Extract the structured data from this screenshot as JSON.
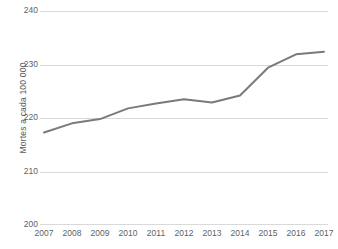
{
  "chart_data": {
    "type": "line",
    "title": "",
    "xlabel": "",
    "ylabel": "Mortes a cada 100 000",
    "categories": [
      "2007",
      "2008",
      "2009",
      "2010",
      "2011",
      "2012",
      "2013",
      "2014",
      "2015",
      "2016",
      "2017"
    ],
    "values": [
      217.3,
      219.0,
      219.8,
      221.8,
      222.7,
      223.5,
      222.9,
      224.2,
      229.4,
      231.9,
      232.4
    ],
    "series": [
      {
        "name": "Mortes a cada 100 000",
        "values": [
          217.3,
          219.0,
          219.8,
          221.8,
          222.7,
          223.5,
          222.9,
          224.2,
          229.4,
          231.9,
          232.4
        ]
      }
    ],
    "ylim": [
      200,
      240
    ],
    "ytick_labels": [
      "240",
      "230",
      "220",
      "210",
      "200"
    ],
    "ytick_values": [
      240,
      230,
      220,
      210,
      200
    ],
    "xtick_labels": [
      "2007",
      "2008",
      "2009",
      "2010",
      "2011",
      "2012",
      "2013",
      "2014",
      "2015",
      "2016",
      "2017"
    ],
    "grid": "horizontal",
    "legend": "none",
    "colors": {
      "line": "#7a7a7a",
      "gridline": "#d9d9d9",
      "axis_text": "#5f5f5f",
      "axis_title": "#5a5a5a",
      "background": "#ffffff"
    }
  }
}
